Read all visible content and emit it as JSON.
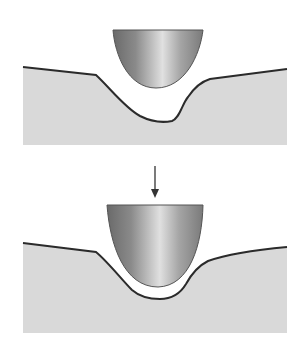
{
  "diagram": {
    "panels": [
      {
        "id": "before",
        "label": ""
      },
      {
        "id": "after",
        "label": ""
      }
    ],
    "arrow": {
      "direction": "down"
    },
    "colors": {
      "background": "#ffffff",
      "substrate_fill": "#d9d9d9",
      "surface_line": "#2b2b2b",
      "indenter_dark": "#6e6e6e",
      "indenter_light": "#e4e4e4",
      "indenter_edge": "#555555",
      "arrow": "#333333"
    }
  }
}
